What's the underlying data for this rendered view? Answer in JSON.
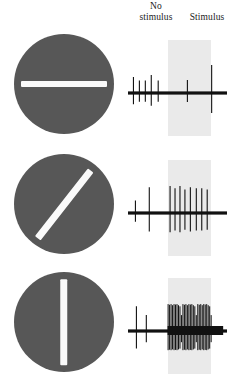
{
  "figure": {
    "header": {
      "no_stimulus_line1": "No",
      "no_stimulus_line2": "stimulus",
      "stimulus_label": "Stimulus"
    },
    "colors": {
      "disc_gray": "#575757",
      "bar_white": "#fafafa",
      "stimulus_band_gray": "#eaeaea",
      "trace_black": "#111111",
      "background": "#ffffff"
    }
  },
  "chart_data": {
    "type": "line",
    "xlabel": "Time",
    "ylabel": "Extracellular voltage (spikes)",
    "grid": false,
    "legend_position": "top",
    "annotations": [
      "No stimulus",
      "Stimulus"
    ],
    "stimulus_window": {
      "label": "Stimulus",
      "start_fraction": 0.4,
      "end_fraction": 0.84
    },
    "rows": [
      {
        "index": 0,
        "stimulus_orientation_deg": 0,
        "stimulus_orientation_name": "horizontal",
        "bar_angle_css_deg": 0,
        "response_description": "Weak response: firing rate barely changes when the horizontal bar appears.",
        "baseline_spike_count": 5,
        "stimulus_spike_count": 2,
        "spikes_prestimulus_fraction": [
          0.055,
          0.115,
          0.175,
          0.235,
          0.305
        ],
        "spikes_stimulus_fraction": [
          0.6,
          0.845
        ],
        "spike_amplitudes": [
          0.45,
          0.3,
          0.3,
          0.55,
          0.3,
          0.32,
          1.0
        ]
      },
      {
        "index": 1,
        "stimulus_orientation_deg": 45,
        "stimulus_orientation_name": "oblique",
        "bar_angle_css_deg": -52,
        "response_description": "Moderate response: regular train of spikes during the oblique bar.",
        "baseline_spike_count": 2,
        "stimulus_spike_count": 8,
        "spikes_prestimulus_fraction": [
          0.075,
          0.215
        ],
        "spikes_stimulus_fraction": [
          0.425,
          0.475,
          0.525,
          0.575,
          0.63,
          0.69,
          0.745,
          0.8
        ],
        "spike_amplitudes": [
          0.3,
          0.9,
          0.95,
          0.85,
          0.95,
          0.8,
          0.9,
          0.85,
          0.85,
          0.8
        ]
      },
      {
        "index": 2,
        "stimulus_orientation_deg": 90,
        "stimulus_orientation_name": "vertical",
        "bar_angle_css_deg": 90,
        "response_description": "Strong response: dense burst of spikes throughout the vertical bar presentation.",
        "baseline_spike_count": 2,
        "stimulus_spike_count": 30,
        "spikes_prestimulus_fraction": [
          0.085,
          0.185
        ],
        "spikes_stimulus_fraction": [
          0.405,
          0.42,
          0.435,
          0.45,
          0.465,
          0.48,
          0.495,
          0.51,
          0.525,
          0.54,
          0.555,
          0.57,
          0.585,
          0.6,
          0.615,
          0.63,
          0.645,
          0.66,
          0.675,
          0.69,
          0.705,
          0.72,
          0.735,
          0.75,
          0.765,
          0.78,
          0.795,
          0.81,
          0.825,
          0.84
        ],
        "spike_amplitudes": [
          0.85,
          0.45,
          0.95,
          0.92,
          0.95,
          0.9,
          0.95,
          0.93,
          0.95,
          0.9
        ]
      }
    ]
  }
}
